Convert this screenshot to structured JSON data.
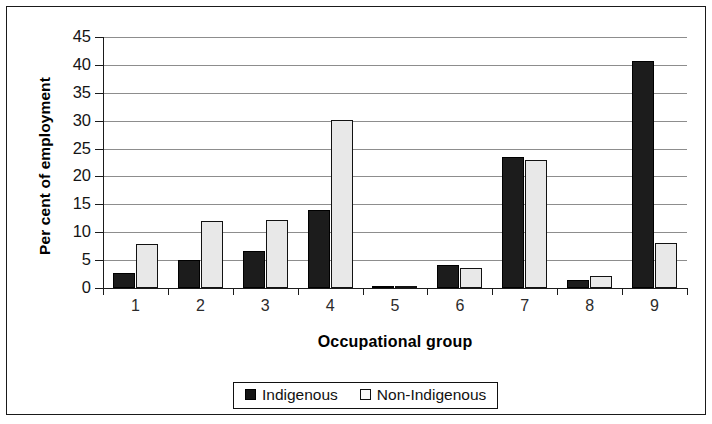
{
  "chart_data": {
    "type": "bar",
    "title": "",
    "xlabel": "Occupational group",
    "ylabel": "Per cent of employment",
    "categories": [
      "1",
      "2",
      "3",
      "4",
      "5",
      "6",
      "7",
      "8",
      "9"
    ],
    "series": [
      {
        "name": "Indigenous",
        "color": "#1c1c1c",
        "values": [
          2.7,
          5.0,
          6.6,
          13.9,
          0.3,
          4.1,
          23.5,
          1.5,
          40.7
        ]
      },
      {
        "name": "Non-Indigenous",
        "color": "#e8e8e8",
        "values": [
          7.9,
          12.0,
          12.2,
          30.1,
          0.2,
          3.6,
          23.0,
          2.2,
          8.1
        ]
      }
    ],
    "ylim": [
      0,
      45
    ],
    "ytick_step": 5,
    "yticks": [
      "0",
      "5",
      "10",
      "15",
      "20",
      "25",
      "30",
      "35",
      "40",
      "45"
    ],
    "grid": true,
    "legend_position": "bottom"
  },
  "legend": {
    "items": [
      {
        "label": "Indigenous",
        "swatch": "filled-black-square"
      },
      {
        "label": "Non-Indigenous",
        "swatch": "outlined-white-square"
      }
    ]
  }
}
